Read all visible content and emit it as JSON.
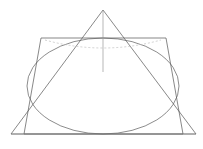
{
  "figure": {
    "canvas": {
      "width": 203,
      "height": 149,
      "background": "#ffffff"
    },
    "colors": {
      "outline": "#555555",
      "ellipse": "#5a5a5a",
      "axis": "#9a9a9a",
      "dashed": "#bdbdbd",
      "baseline": "#8a8a8a"
    },
    "shapes": {
      "triangle": {
        "name": "cone-outline-triangle",
        "apex": {
          "x": 103,
          "y": 10
        },
        "base_left": {
          "x": 11,
          "y": 134
        },
        "base_right": {
          "x": 196,
          "y": 134
        },
        "points": "103,10 11,134 196,134"
      },
      "rectangle": {
        "name": "cross-section-rectangle",
        "top_left": {
          "x": 41,
          "y": 38
        },
        "top_right": {
          "x": 166,
          "y": 38
        },
        "bottom_right": {
          "x": 183,
          "y": 134
        },
        "bottom_left": {
          "x": 24,
          "y": 134
        },
        "points": "41,38 166,38 183,134 24,134"
      },
      "ellipse": {
        "name": "inscribed-ellipse",
        "center": {
          "x": 103,
          "y": 86
        },
        "rx": 76,
        "ry": 48,
        "left_extent": 27,
        "right_extent": 179,
        "top_extent": 38,
        "bottom_extent": 134
      },
      "dashed_arc": {
        "name": "hidden-rim-arc",
        "path": "M 45 40 Q 103 56 161 40",
        "start": {
          "x": 45,
          "y": 40
        },
        "end": {
          "x": 161,
          "y": 40
        },
        "control": {
          "x": 103,
          "y": 56
        }
      },
      "axis_line": {
        "name": "vertical-axis-line",
        "start": {
          "x": 103,
          "y": 11
        },
        "end": {
          "x": 103,
          "y": 72
        }
      },
      "base_line": {
        "name": "base-horizontal-line",
        "start": {
          "x": 11,
          "y": 134
        },
        "end": {
          "x": 196,
          "y": 134
        }
      }
    }
  }
}
